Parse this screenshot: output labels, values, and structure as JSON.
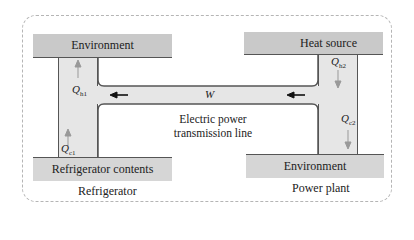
{
  "diagram": {
    "refrigerator": {
      "hot_reservoir": "Environment",
      "cold_reservoir": "Refrigerator contents",
      "caption": "Refrigerator",
      "q_hot": {
        "symbol": "Q",
        "sub": "h1"
      },
      "q_cold": {
        "symbol": "Q",
        "sub": "c1"
      }
    },
    "power_plant": {
      "hot_reservoir": "Heat source",
      "cold_reservoir": "Environment",
      "caption": "Power plant",
      "q_hot": {
        "symbol": "Q",
        "sub": "h2"
      },
      "q_cold": {
        "symbol": "Q",
        "sub": "c2"
      }
    },
    "work": {
      "symbol": "W"
    },
    "link_label_line1": "Electric power",
    "link_label_line2": "transmission line",
    "colors": {
      "reservoir": "#c9c9c9",
      "conduit": "#e6e6e6",
      "arrow_gray": "#999999",
      "arrow_black": "#111111",
      "border": "#555555",
      "dashed_frame": "#b5b5b5"
    }
  }
}
